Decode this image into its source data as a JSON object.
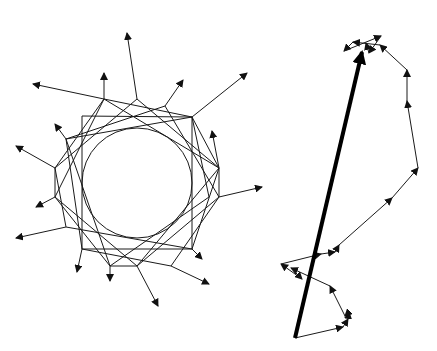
{
  "figure": {
    "background": "#ffffff",
    "stroke_color": "#1a1a1a",
    "left_diagram": {
      "name": "star-vector-figure",
      "description": "16-fold symmetric pattern of arrows arranged around an inner circle",
      "center": [
        137,
        183
      ],
      "inner_radius": 55,
      "segments": [
        [
          [
            104,
            99
          ],
          [
            33,
            84
          ]
        ],
        [
          [
            104,
            99
          ],
          [
            104,
            73
          ]
        ],
        [
          [
            137,
            99
          ],
          [
            127,
            33
          ]
        ],
        [
          [
            165,
            106
          ],
          [
            183,
            80
          ]
        ],
        [
          [
            192,
            117
          ],
          [
            247,
            73
          ]
        ],
        [
          [
            219,
            168
          ],
          [
            212,
            131
          ]
        ],
        [
          [
            219,
            197
          ],
          [
            262,
            187
          ]
        ],
        [
          [
            192,
            249
          ],
          [
            202,
            259
          ]
        ],
        [
          [
            171,
            266
          ],
          [
            209,
            284
          ]
        ],
        [
          [
            137,
            266
          ],
          [
            158,
            306
          ]
        ],
        [
          [
            110,
            266
          ],
          [
            110,
            281
          ]
        ],
        [
          [
            82,
            249
          ],
          [
            77,
            272
          ]
        ],
        [
          [
            66,
            227
          ],
          [
            16,
            238
          ]
        ],
        [
          [
            55,
            197
          ],
          [
            36,
            207
          ]
        ],
        [
          [
            55,
            168
          ],
          [
            16,
            146
          ]
        ],
        [
          [
            66,
            139
          ],
          [
            55,
            124
          ]
        ]
      ],
      "polygon_a": [
        [
          82,
          116
        ],
        [
          82,
          249
        ],
        [
          192,
          249
        ],
        [
          192,
          117
        ]
      ],
      "polygon_b": [
        [
          137,
          99
        ],
        [
          219,
          168
        ],
        [
          219,
          197
        ],
        [
          137,
          266
        ],
        [
          55,
          197
        ],
        [
          55,
          168
        ]
      ],
      "polygon_c": [
        [
          104,
          99
        ],
        [
          219,
          168
        ],
        [
          192,
          249
        ],
        [
          66,
          227
        ],
        [
          55,
          168
        ]
      ],
      "polygon_d": [
        [
          165,
          106
        ],
        [
          219,
          197
        ],
        [
          171,
          266
        ],
        [
          82,
          249
        ],
        [
          66,
          139
        ]
      ],
      "polygon_e": [
        [
          192,
          117
        ],
        [
          209,
          197
        ],
        [
          110,
          266
        ],
        [
          55,
          197
        ],
        [
          104,
          99
        ]
      ],
      "polygon_f": [
        [
          66,
          139
        ],
        [
          192,
          117
        ],
        [
          219,
          168
        ],
        [
          137,
          266
        ],
        [
          110,
          266
        ]
      ]
    },
    "right_diagram": {
      "name": "random-walk-vector-sum",
      "description": "chain of small head-to-tail arrows with a thick resultant arrow from start to end",
      "path": [
        [
          295,
          338
        ],
        [
          343,
          327
        ],
        [
          348,
          319
        ],
        [
          349,
          312
        ],
        [
          345,
          316
        ],
        [
          330,
          286
        ],
        [
          291,
          268
        ],
        [
          302,
          279
        ],
        [
          281,
          264
        ],
        [
          321,
          254
        ],
        [
          335,
          252
        ],
        [
          339,
          245
        ],
        [
          392,
          198
        ],
        [
          418,
          168
        ],
        [
          407,
          101
        ],
        [
          407,
          70
        ],
        [
          380,
          45
        ],
        [
          353,
          42
        ],
        [
          344,
          51
        ],
        [
          381,
          36
        ],
        [
          369,
          53
        ],
        [
          366,
          43
        ]
      ],
      "resultant": {
        "from": [
          295,
          338
        ],
        "to": [
          362,
          52
        ]
      }
    }
  }
}
